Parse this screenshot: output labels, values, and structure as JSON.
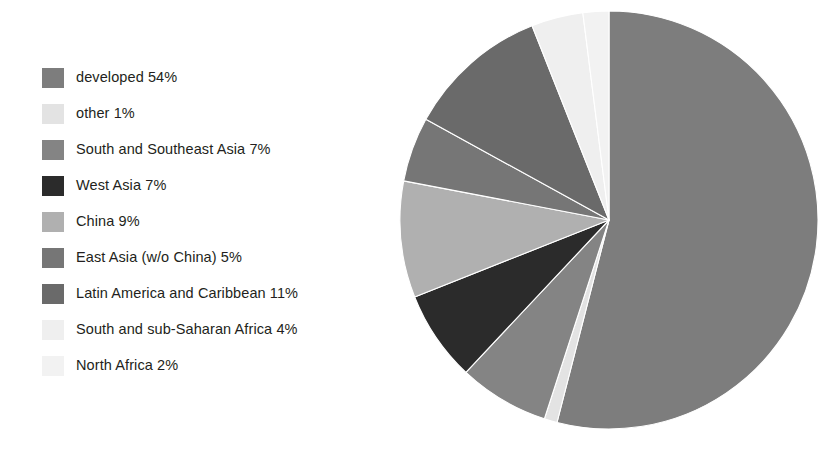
{
  "chart_data": {
    "type": "pie",
    "title": "",
    "subtitle": "",
    "xlabel": "",
    "ylabel": "",
    "units": "percent",
    "legend_position": "left",
    "grid": false,
    "start_angle_deg": 0,
    "direction": "clockwise",
    "total": 100,
    "categories": [
      "developed",
      "other",
      "South and Southeast Asia",
      "West Asia",
      "China",
      "East Asia (w/o China)",
      "Latin America and Caribbean",
      "South and sub-Saharan Africa",
      "North Africa"
    ],
    "values": [
      54,
      1,
      7,
      7,
      9,
      5,
      11,
      4,
      2
    ],
    "colors": [
      "#7d7d7d",
      "#e3e3e3",
      "#848484",
      "#2b2b2b",
      "#b0b0b0",
      "#767676",
      "#6a6a6a",
      "#efefef",
      "#f2f2f2"
    ],
    "slices": [
      {
        "label": "developed",
        "value": 54,
        "value_label": "54%",
        "color": "#7d7d7d"
      },
      {
        "label": "other",
        "value": 1,
        "value_label": "1%",
        "color": "#e3e3e3"
      },
      {
        "label": "South and Southeast Asia",
        "value": 7,
        "value_label": "7%",
        "color": "#848484"
      },
      {
        "label": "West Asia",
        "value": 7,
        "value_label": "7%",
        "color": "#2b2b2b"
      },
      {
        "label": "China",
        "value": 9,
        "value_label": "9%",
        "color": "#b0b0b0"
      },
      {
        "label": "East Asia (w/o China)",
        "value": 5,
        "value_label": "5%",
        "color": "#767676"
      },
      {
        "label": "Latin America and Caribbean",
        "value": 11,
        "value_label": "11%",
        "color": "#6a6a6a"
      },
      {
        "label": "South and sub-Saharan Africa",
        "value": 4,
        "value_label": "4%",
        "color": "#efefef"
      },
      {
        "label": "North Africa",
        "value": 2,
        "value_label": "2%",
        "color": "#f2f2f2"
      }
    ]
  },
  "legend": {
    "items": [
      {
        "text": "developed 54%",
        "color": "#7d7d7d"
      },
      {
        "text": "other 1%",
        "color": "#e3e3e3"
      },
      {
        "text": "South and Southeast Asia 7%",
        "color": "#848484"
      },
      {
        "text": "West Asia 7%",
        "color": "#2b2b2b"
      },
      {
        "text": "China 9%",
        "color": "#b0b0b0"
      },
      {
        "text": "East Asia (w/o China) 5%",
        "color": "#767676"
      },
      {
        "text": "Latin America and Caribbean 11%",
        "color": "#6a6a6a"
      },
      {
        "text": "South and sub-Saharan Africa 4%",
        "color": "#efefef"
      },
      {
        "text": "North Africa 2%",
        "color": "#f2f2f2"
      }
    ]
  },
  "pie": {
    "center_x": 210,
    "center_y": 210,
    "radius": 209
  }
}
